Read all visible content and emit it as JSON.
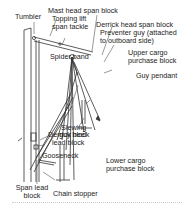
{
  "diagram": {
    "type": "ship derrick rigging diagram",
    "labels": {
      "tumbler": "Tumbler",
      "mast_head_span_block": "Mast head span block",
      "topping_lift_1": "Topping lift",
      "topping_lift_2": "span tackle",
      "derrick_head_span_block": "Derrick head span block",
      "preventer_guy_1": "Preventer guy (attached",
      "preventer_guy_2": "to outboard side)",
      "spider_band": "Spider band",
      "upper_cargo_1": "Upper cargo",
      "upper_cargo_2": "purchase block",
      "guy_pendant": "Guy pendant",
      "slewing_1": "Slewing",
      "slewing_2": "guy block",
      "derrick_heel_1": "Derrick heel",
      "derrick_heel_2": "lead block",
      "gooseneck": "Gooseneck",
      "lower_cargo_1": "Lower cargo",
      "lower_cargo_2": "purchase block",
      "span_lead_1": "Span lead",
      "span_lead_2": "block",
      "chain_stopper": "Chain stopper"
    },
    "colors": {
      "line": "#333333",
      "text": "#222222",
      "background": "#ffffff"
    }
  }
}
